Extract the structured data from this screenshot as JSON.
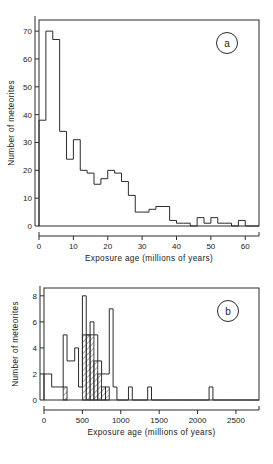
{
  "figure": {
    "title": "",
    "panels": [
      "a",
      "b"
    ]
  },
  "panel_a": {
    "label": "a",
    "xlabel": "Exposure  age  (millions  of  years)",
    "ylabel": "Number  of  meteorites",
    "xticks": [
      "0",
      "10",
      "20",
      "30",
      "40",
      "50",
      "60"
    ],
    "yticks": [
      "0",
      "10",
      "20",
      "30",
      "40",
      "50",
      "60",
      "70"
    ]
  },
  "panel_b": {
    "label": "b",
    "xlabel": "Exposure  age  (millions  of  years)",
    "ylabel": "Number  of  meteorites",
    "xticks": [
      "0",
      "500",
      "1000",
      "1500",
      "2000",
      "2500"
    ],
    "yticks": [
      "0",
      "2",
      "4",
      "6",
      "8"
    ]
  },
  "chart_data": [
    {
      "type": "bar",
      "id": "panel-a",
      "title": "a",
      "xlabel": "Exposure age (millions of years)",
      "ylabel": "Number of meteorites",
      "xlim": [
        0,
        64
      ],
      "ylim": [
        0,
        74
      ],
      "bin_width": 2,
      "grid": false,
      "legend": false,
      "bin_edges": [
        0,
        2,
        4,
        6,
        8,
        10,
        12,
        14,
        16,
        18,
        20,
        22,
        24,
        26,
        28,
        30,
        32,
        34,
        36,
        38,
        40,
        42,
        44,
        46,
        48,
        50,
        52,
        54,
        56,
        58,
        60,
        62,
        64
      ],
      "values": [
        38,
        70,
        67,
        34,
        24,
        31,
        20,
        19,
        15,
        17,
        20,
        19,
        16,
        11,
        5,
        5,
        6,
        7,
        7,
        2,
        1,
        1,
        0,
        3,
        1,
        3,
        1,
        1,
        0,
        2,
        0,
        0
      ]
    },
    {
      "type": "bar",
      "id": "panel-b",
      "title": "b",
      "xlabel": "Exposure age (millions of years)",
      "ylabel": "Number of meteorites",
      "xlim": [
        0,
        2800
      ],
      "ylim": [
        0,
        8.6
      ],
      "bin_width": 50,
      "grid": false,
      "legend": false,
      "series": [
        {
          "name": "all meteorites",
          "style": "open",
          "bin_edges": [
            0,
            50,
            100,
            150,
            200,
            250,
            300,
            350,
            400,
            450,
            500,
            550,
            600,
            650,
            700,
            750,
            800,
            850,
            900,
            950,
            1000,
            1050,
            1100,
            1150,
            1200,
            1250,
            1300,
            1350,
            1400,
            1450,
            1500,
            1550,
            1600,
            1650,
            1700,
            1750,
            1800,
            1850,
            1900,
            1950,
            2000,
            2050,
            2100,
            2150,
            2200,
            2250,
            2300,
            2350,
            2400,
            2450,
            2500,
            2550,
            2600,
            2650,
            2700,
            2750,
            2800
          ],
          "values": [
            2,
            2,
            1,
            1,
            1,
            5,
            3,
            3,
            4,
            1,
            8,
            5,
            6,
            5,
            3,
            2,
            2,
            7,
            1,
            0,
            0,
            0,
            1,
            0,
            0,
            0,
            0,
            1,
            0,
            0,
            0,
            0,
            0,
            0,
            0,
            0,
            0,
            0,
            0,
            0,
            0,
            0,
            0,
            1,
            0,
            0,
            0,
            0,
            0,
            0,
            0,
            0,
            0,
            0,
            0,
            0
          ]
        },
        {
          "name": "hatched subset",
          "style": "hatched",
          "bars": [
            {
              "x0": 250,
              "x1": 300,
              "value": 1
            },
            {
              "x0": 500,
              "x1": 550,
              "value": 5
            },
            {
              "x0": 550,
              "x1": 600,
              "value": 5
            },
            {
              "x0": 600,
              "x1": 650,
              "value": 5
            },
            {
              "x0": 650,
              "x1": 700,
              "value": 3
            },
            {
              "x0": 700,
              "x1": 750,
              "value": 2
            },
            {
              "x0": 750,
              "x1": 800,
              "value": 1
            },
            {
              "x0": 800,
              "x1": 850,
              "value": 1
            }
          ]
        }
      ]
    }
  ]
}
